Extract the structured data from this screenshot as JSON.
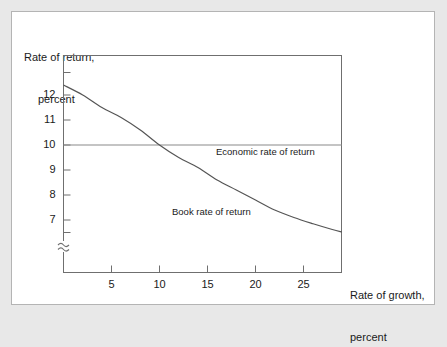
{
  "chart_data": {
    "type": "line",
    "title": "",
    "xlabel": "Rate of growth, percent",
    "ylabel": "Rate of return, percent",
    "xlim": [
      0,
      29
    ],
    "ylim": [
      6.0,
      13.0
    ],
    "grid": false,
    "legend_position": "inline-annotation",
    "axis_break": {
      "axis": "y",
      "symbol": "squiggle",
      "note": "y-axis broken below lowest tick"
    },
    "xticks": [
      5,
      10,
      15,
      20,
      25
    ],
    "xtick_labels": [
      "5",
      "10",
      "15",
      "20",
      "25"
    ],
    "yticks": [
      7,
      8,
      9,
      10,
      11,
      12
    ],
    "ytick_labels": [
      "7",
      "8",
      "9",
      "10",
      "11",
      "12"
    ],
    "unlabeled_yticks": [
      6.5,
      12.9
    ],
    "series": [
      {
        "name": "Book rate of return",
        "annotation": "Book rate of return",
        "x": [
          0,
          2,
          4,
          6,
          8,
          10,
          12,
          14,
          16,
          18,
          20,
          22,
          24,
          26,
          28,
          29
        ],
        "values": [
          12.4,
          12.0,
          11.5,
          11.1,
          10.6,
          10.0,
          9.5,
          9.1,
          8.6,
          8.2,
          7.8,
          7.4,
          7.1,
          6.85,
          6.62,
          6.52
        ]
      },
      {
        "name": "Economic rate of return",
        "annotation": "Economic rate of return",
        "x": [
          0,
          29
        ],
        "values": [
          10,
          10
        ]
      }
    ],
    "colors": {
      "book_line": "#555555",
      "economic_line": "#8a8a8a",
      "axis": "#6f6f6f",
      "text": "#1a1a1a",
      "panel_background": "#ffffff",
      "outer_background": "#e8e8e8",
      "panel_border": "#b4b4b4"
    }
  },
  "axes": {
    "y_title_line1": "Rate of return,",
    "y_title_line2": "percent",
    "x_title_line1": "Rate of growth,",
    "x_title_line2": "percent"
  },
  "annotations": {
    "economic": "Economic rate of return",
    "book": "Book rate of return"
  }
}
